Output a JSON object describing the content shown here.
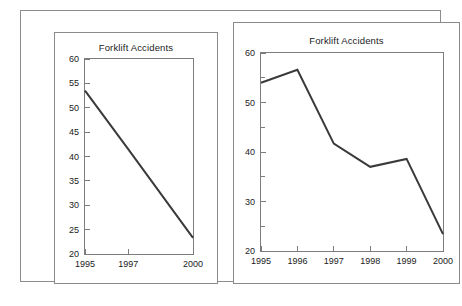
{
  "figure": {
    "background": "#ffffff",
    "frame_color": "#8c8c8c",
    "panel_border_color": "#8a8a8a",
    "axis_color": "#7d7d7d",
    "line_color": "#3a3a3a"
  },
  "chart_data": [
    {
      "id": "left",
      "type": "line",
      "title": "Forklift Accidents",
      "xlabel": "",
      "ylabel": "",
      "grid": false,
      "legend": null,
      "x_tick_labels": [
        "1995",
        "1997",
        "2000"
      ],
      "x_tick_positions": [
        1995,
        1997,
        2000
      ],
      "xlim": [
        1995,
        2000
      ],
      "x_axis_note": "category-style axis: ticks unevenly spaced, only 1995, 1997 and 2000 shown",
      "y_tick_labels": [
        "20",
        "25",
        "30",
        "35",
        "40",
        "45",
        "50",
        "55",
        "60"
      ],
      "y_ticks": [
        20,
        25,
        30,
        35,
        40,
        45,
        50,
        55,
        60
      ],
      "ylim": [
        20,
        60
      ],
      "categories": [
        "1995",
        "1997",
        "2000"
      ],
      "values": [
        53.5,
        41.5,
        23.3
      ]
    },
    {
      "id": "right",
      "type": "line",
      "title": "Forklift Accidents",
      "xlabel": "",
      "ylabel": "",
      "grid": false,
      "legend": null,
      "x_tick_labels": [
        "1995",
        "1996",
        "1997",
        "1998",
        "1999",
        "2000"
      ],
      "x_tick_positions": [
        1995,
        1996,
        1997,
        1998,
        1999,
        2000
      ],
      "xlim": [
        1995,
        2000
      ],
      "y_tick_labels": [
        "20",
        "30",
        "40",
        "50",
        "60"
      ],
      "y_ticks": [
        20,
        30,
        40,
        50,
        60
      ],
      "y_minor_ticks": [
        25,
        35,
        45,
        55
      ],
      "ylim": [
        20,
        60
      ],
      "categories": [
        "1995",
        "1996",
        "1997",
        "1998",
        "1999",
        "2000"
      ],
      "values": [
        54.0,
        56.6,
        41.7,
        37.0,
        38.6,
        23.4
      ]
    }
  ]
}
